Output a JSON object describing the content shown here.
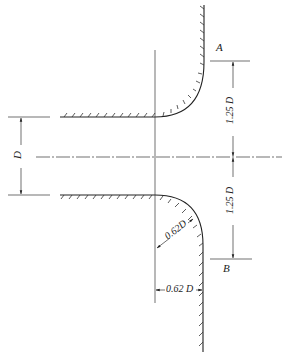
{
  "diagram": {
    "stroke_color": "#222222",
    "labels": {
      "point_a": "A",
      "point_b": "B",
      "diameter": "D",
      "upper_length": "1.25 D",
      "lower_length": "1.25 D",
      "radius": "0.62D",
      "offset": "0.62 D"
    }
  }
}
